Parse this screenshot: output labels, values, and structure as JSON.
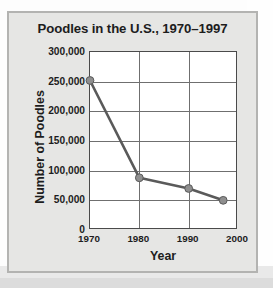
{
  "chart_data": {
    "type": "line",
    "title": "Poodles in the U.S., 1970–1997",
    "xlabel": "Year",
    "ylabel": "Number of Poodles",
    "x": [
      1970,
      1980,
      1990,
      1997
    ],
    "values": [
      252000,
      88000,
      70000,
      50000
    ],
    "series": [
      {
        "name": "Number of Poodles",
        "values": [
          252000,
          88000,
          70000,
          50000
        ]
      }
    ],
    "xlim": [
      1970,
      2000
    ],
    "ylim": [
      0,
      300000
    ],
    "xticks": [
      1970,
      1980,
      1990,
      2000
    ],
    "xtick_labels": [
      "1970",
      "1980",
      "1990",
      "2000"
    ],
    "yticks": [
      0,
      50000,
      100000,
      150000,
      200000,
      250000,
      300000
    ],
    "ytick_labels": [
      "0",
      "50,000",
      "100,000",
      "150,000",
      "200,000",
      "250,000",
      "300,000"
    ],
    "grid": true,
    "legend": false,
    "line_color": "#5a5a5a",
    "marker_color": "#8f8f8f",
    "marker_edge_color": "#5a5a5a",
    "plot_background": "#ffffff",
    "panel_background": "#e6e6e4",
    "text_color": "#1d1d1d"
  }
}
